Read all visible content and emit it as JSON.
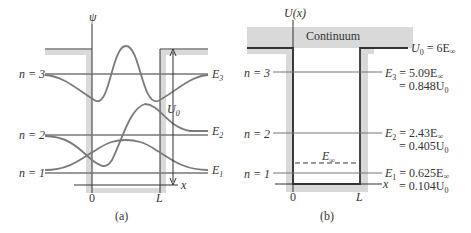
{
  "panel_a": {
    "caption": "(a)",
    "y_axis_label": "ψ",
    "x_axis_label": "x",
    "x_ticks": [
      "0",
      "L"
    ],
    "well_depth_label": "U",
    "well_depth_sub": "0",
    "levels": [
      {
        "n_label": "n = 3",
        "e_label": "E",
        "e_sub": "3"
      },
      {
        "n_label": "n = 2",
        "e_label": "E",
        "e_sub": "2"
      },
      {
        "n_label": "n = 1",
        "e_label": "E",
        "e_sub": "1"
      }
    ]
  },
  "panel_b": {
    "caption": "(b)",
    "y_axis_label": "U(x)",
    "x_axis_label": "x",
    "x_ticks": [
      "0",
      "L"
    ],
    "continuum_label": "Continuum",
    "u0_label": "U",
    "u0_sub": "0",
    "u0_value": " = 6E",
    "u0_value_sub": "∞",
    "e_inf_label": "E",
    "e_inf_sub": "∞",
    "levels": [
      {
        "n_label": "n = 3",
        "e_label": "E",
        "e_sub": "3",
        "eq1": " = 5.09E",
        "eq1_sub": "∞",
        "eq2": "= 0.848U",
        "eq2_sub": "0"
      },
      {
        "n_label": "n = 2",
        "e_label": "E",
        "e_sub": "2",
        "eq1": " = 2.43E",
        "eq1_sub": "∞",
        "eq2": "= 0.405U",
        "eq2_sub": "0"
      },
      {
        "n_label": "n = 1",
        "e_label": "E",
        "e_sub": "1",
        "eq1": " = 0.625E",
        "eq1_sub": "∞",
        "eq2": "= 0.104U",
        "eq2_sub": "0"
      }
    ]
  },
  "colors": {
    "well_shade": "#d9d9d9",
    "curve": "#7a7a7a",
    "line_dark": "#333333",
    "level_line": "#777777"
  }
}
